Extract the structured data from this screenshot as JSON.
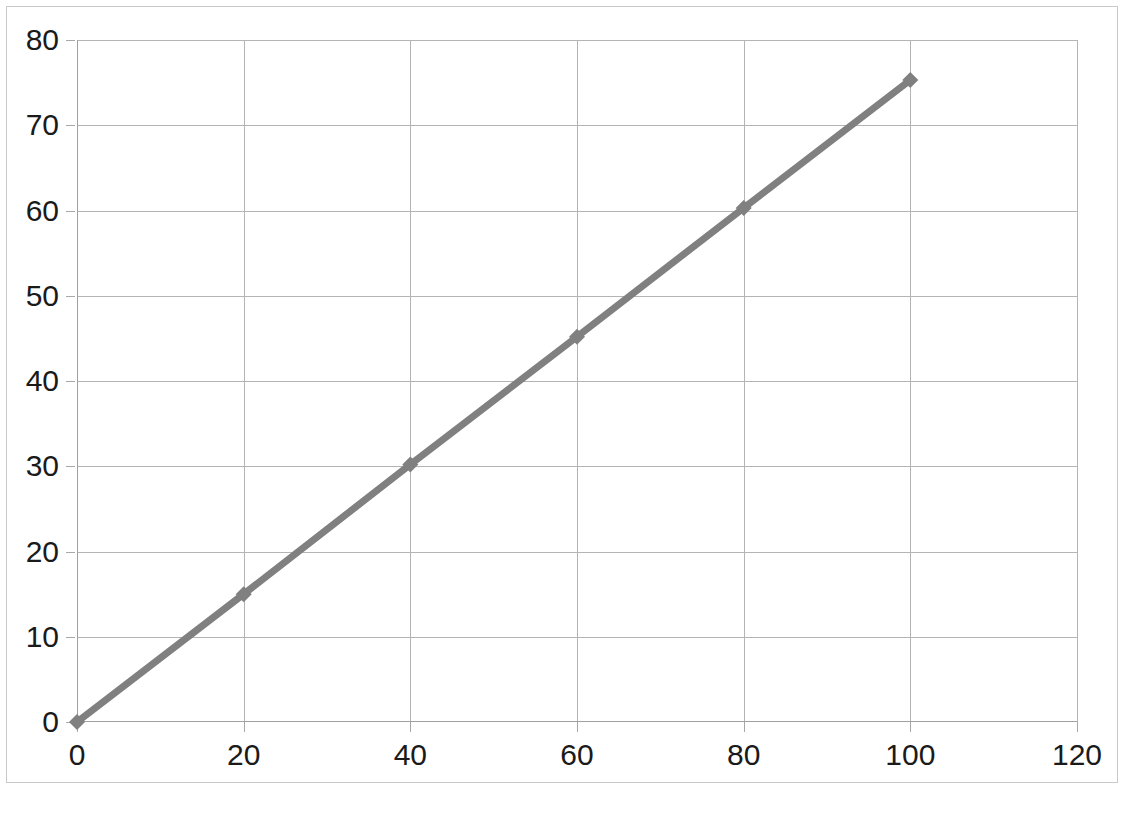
{
  "chart_data": {
    "type": "line",
    "title": "",
    "subtitle": "",
    "xlabel": "",
    "ylabel": "",
    "x": [
      0,
      20,
      40,
      60,
      80,
      100
    ],
    "values": [
      0,
      15.0,
      30.2,
      45.2,
      60.3,
      75.3
    ],
    "series": [
      {
        "name": "Series 1",
        "x": [
          0,
          20,
          40,
          60,
          80,
          100
        ],
        "values": [
          0,
          15.0,
          30.2,
          45.2,
          60.3,
          75.3
        ]
      }
    ],
    "xlim": [
      0,
      120
    ],
    "ylim": [
      0,
      80
    ],
    "xticks": [
      0,
      20,
      40,
      60,
      80,
      100,
      120
    ],
    "yticks": [
      0,
      10,
      20,
      30,
      40,
      50,
      60,
      70,
      80
    ],
    "xtick_labels": [
      "0",
      "20",
      "40",
      "60",
      "80",
      "100",
      "120"
    ],
    "ytick_labels": [
      "0",
      "10",
      "20",
      "30",
      "40",
      "50",
      "60",
      "70",
      "80"
    ],
    "grid": true,
    "grid_axis": "both",
    "legend": false,
    "legend_position": "none",
    "marker": "diamond",
    "annotations": []
  },
  "style": {
    "series_color": "#808080",
    "grid_color": "#b4b4b4",
    "axis_color": "#a0a0a0",
    "frame_color": "#c9c9c9",
    "label_color": "#1a1a1a",
    "background": "#ffffff",
    "line_width": 7,
    "marker_size": 16
  }
}
